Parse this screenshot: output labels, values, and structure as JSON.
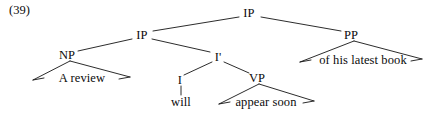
{
  "figure": {
    "example_number": "(39)",
    "kind": "syntax-tree",
    "sentence": "A review will appear soon of his latest book",
    "ink_color": "#141414",
    "background_color": "#ffffff"
  },
  "nodes": [
    {
      "id": "ip-top",
      "label": "IP",
      "x": 249,
      "y": 13,
      "type": "nonterminal"
    },
    {
      "id": "ip-mid",
      "label": "IP",
      "x": 142,
      "y": 35,
      "type": "nonterminal"
    },
    {
      "id": "pp",
      "label": "PP",
      "x": 351,
      "y": 35,
      "type": "nonterminal"
    },
    {
      "id": "np",
      "label": "NP",
      "x": 67,
      "y": 55,
      "type": "nonterminal"
    },
    {
      "id": "i-bar",
      "label": "I'",
      "x": 218,
      "y": 57,
      "type": "nonterminal"
    },
    {
      "id": "i-head",
      "label": "I",
      "x": 180,
      "y": 80,
      "type": "nonterminal"
    },
    {
      "id": "vp",
      "label": "VP",
      "x": 257,
      "y": 78,
      "type": "nonterminal"
    }
  ],
  "terminals": [
    {
      "id": "t-a-review",
      "label": "A review",
      "x": 82,
      "y": 78,
      "parent": "np",
      "triangle": true
    },
    {
      "id": "t-will",
      "label": "will",
      "x": 181,
      "y": 102,
      "parent": "i-head",
      "triangle": false
    },
    {
      "id": "t-appear-soon",
      "label": "appear soon",
      "x": 266,
      "y": 102,
      "parent": "vp",
      "triangle": true
    },
    {
      "id": "t-of-his-book",
      "label": "of his latest book",
      "x": 363,
      "y": 60,
      "parent": "pp",
      "triangle": true
    }
  ],
  "edges": [
    {
      "id": "e-iptop-ipmid",
      "from": "ip-top",
      "to": "ip-mid",
      "x1": 239,
      "y1": 17,
      "x2": 153,
      "y2": 31
    },
    {
      "id": "e-iptop-pp",
      "from": "ip-top",
      "to": "pp",
      "x1": 261,
      "y1": 17,
      "x2": 341,
      "y2": 31
    },
    {
      "id": "e-ipmid-np",
      "from": "ip-mid",
      "to": "np",
      "x1": 132,
      "y1": 39,
      "x2": 78,
      "y2": 51
    },
    {
      "id": "e-ipmid-ibar",
      "from": "ip-mid",
      "to": "i-bar",
      "x1": 152,
      "y1": 39,
      "x2": 210,
      "y2": 52
    },
    {
      "id": "e-ibar-i",
      "from": "i-bar",
      "to": "i-head",
      "x1": 212,
      "y1": 62,
      "x2": 184,
      "y2": 75
    },
    {
      "id": "e-ibar-vp",
      "from": "i-bar",
      "to": "vp",
      "x1": 224,
      "y1": 62,
      "x2": 249,
      "y2": 73
    },
    {
      "id": "e-i-will",
      "from": "i-head",
      "to": "t-will",
      "x1": 181,
      "y1": 86,
      "x2": 181,
      "y2": 95
    }
  ],
  "triangles": [
    {
      "id": "tri-np",
      "parent": "np",
      "apex_x": 70,
      "apex_y": 61,
      "left_x": 33,
      "left_y": 80,
      "right_x": 130,
      "right_y": 77
    },
    {
      "id": "tri-vp",
      "parent": "vp",
      "apex_x": 259,
      "apex_y": 84,
      "left_x": 219,
      "left_y": 104,
      "right_x": 314,
      "right_y": 101
    },
    {
      "id": "tri-pp",
      "parent": "pp",
      "apex_x": 354,
      "apex_y": 41,
      "left_x": 300,
      "left_y": 62,
      "right_x": 422,
      "right_y": 59
    }
  ]
}
